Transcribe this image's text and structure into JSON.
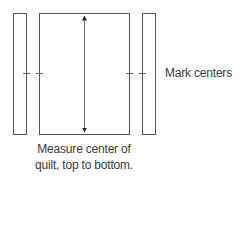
{
  "diagram": {
    "type": "quilt-measurement-illustration",
    "elements": {
      "left_strip": {
        "label": "border strip (left)"
      },
      "quilt_body": {
        "label": "quilt center"
      },
      "right_strip": {
        "label": "border strip (right)"
      },
      "measure_arrow": {
        "label": "double-headed vertical arrow"
      },
      "center_marks": {
        "label": "center tick marks"
      }
    },
    "labels": {
      "mark_centers": "Mark centers",
      "caption_line1": "Measure center of",
      "caption_line2": "quilt, top to bottom."
    },
    "colors": {
      "stroke": "#555555",
      "text": "#3a3a3a",
      "background": "#ffffff"
    }
  }
}
